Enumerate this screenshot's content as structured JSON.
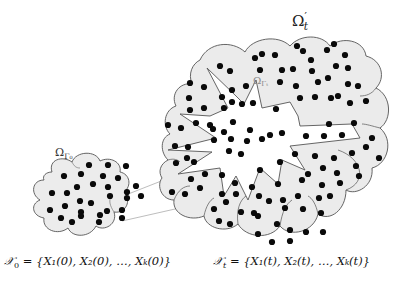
{
  "labels": {
    "region_initial": "Ω",
    "region_initial_sub": "Γ₀",
    "region_inner": "Ω",
    "region_inner_sub": "Γₜ",
    "region_outer": "Ω",
    "region_outer_sup": "′",
    "region_outer_sub": "t"
  },
  "equations": {
    "initial": {
      "lhs": "𝒳",
      "lhs_sub": "0",
      "rhs": " = {X₁(0), X₂(0), …, Xₖ(0)}"
    },
    "time_t": {
      "lhs": "𝒳",
      "lhs_sub": "t",
      "rhs": " = {X₁(t), X₂(t), …, Xₖ(t)}"
    }
  },
  "colors": {
    "cloud_fill": "#ebebeb",
    "cloud_stroke": "#555555",
    "inner_fill": "#ffffff",
    "particle": "#0a0a0a",
    "connector": "#b0b0b0"
  }
}
